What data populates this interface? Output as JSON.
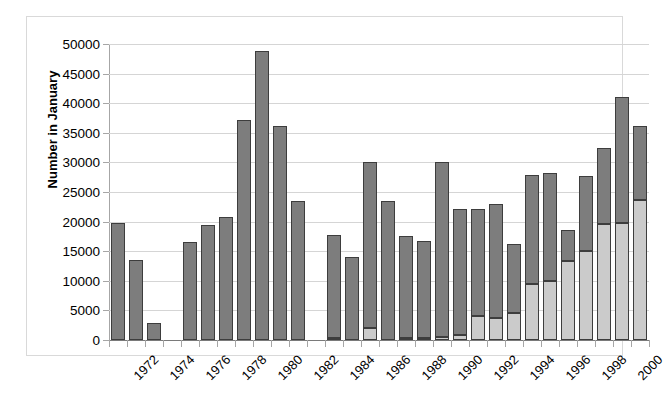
{
  "chart_data": {
    "type": "bar",
    "stacked": true,
    "title": "",
    "xlabel": "",
    "ylabel": "Number in January",
    "ylim": [
      0,
      50000
    ],
    "ytick_step": 5000,
    "ytick_labels": [
      "0",
      "5000",
      "10000",
      "15000",
      "20000",
      "25000",
      "30000",
      "35000",
      "40000",
      "45000",
      "50000"
    ],
    "grid": true,
    "legend": "none",
    "x_label_interval": 2,
    "colors": {
      "series_lower": "#cbcbcb",
      "series_upper": "#7d7d7d",
      "bar_outline": "#3d3d3d",
      "gridline": "#d5d5d5",
      "axis": "#a6a6a6",
      "frame": "#d9d9d9"
    },
    "categories": [
      "1972",
      "1973",
      "1974",
      "1975",
      "1976",
      "1977",
      "1978",
      "1979",
      "1980",
      "1981",
      "1982",
      "1983",
      "1984",
      "1985",
      "1986",
      "1987",
      "1988",
      "1989",
      "1990",
      "1991",
      "1992",
      "1993",
      "1994",
      "1995",
      "1996",
      "1997",
      "1998",
      "1999",
      "2000",
      "2001"
    ],
    "tick_labels": [
      "1972",
      "",
      "1974",
      "",
      "1976",
      "",
      "1978",
      "",
      "1980",
      "",
      "1982",
      "",
      "1984",
      "",
      "1986",
      "",
      "1988",
      "",
      "1990",
      "",
      "1992",
      "",
      "1994",
      "",
      "1996",
      "",
      "1998",
      "",
      "2000",
      ""
    ],
    "series": [
      {
        "name": "lower",
        "values": [
          0,
          0,
          0,
          0,
          0,
          0,
          0,
          0,
          0,
          0,
          0,
          0,
          300,
          0,
          2100,
          0,
          400,
          400,
          500,
          800,
          4000,
          3700,
          4600,
          9400,
          9900,
          13300,
          15000,
          19600,
          19800,
          23600
        ]
      },
      {
        "name": "upper",
        "values": [
          19800,
          13500,
          2900,
          0,
          16500,
          19400,
          20800,
          37100,
          48800,
          36100,
          23400,
          0,
          17500,
          14000,
          27900,
          23500,
          17200,
          16300,
          29500,
          21300,
          18200,
          19200,
          11600,
          18500,
          18300,
          5200,
          12700,
          12900,
          21200,
          12600
        ]
      }
    ],
    "totals": [
      19800,
      13500,
      2900,
      0,
      16500,
      19400,
      20800,
      37100,
      48800,
      36100,
      23400,
      0,
      17800,
      14000,
      30000,
      23500,
      17600,
      16700,
      30000,
      22100,
      22200,
      22900,
      16200,
      27900,
      28200,
      18500,
      27700,
      32500,
      41000,
      36200
    ]
  }
}
